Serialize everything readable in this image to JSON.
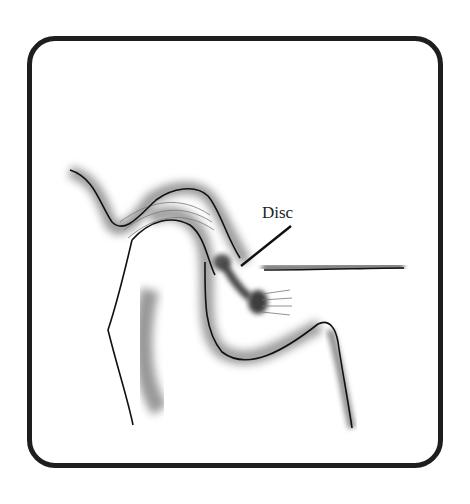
{
  "diagram": {
    "labels": [
      {
        "text": "Disc",
        "points_to": "articular disc"
      }
    ],
    "colors": {
      "frame": "#1e1e1e",
      "shading": "#5a5a5a",
      "line": "#111111",
      "background": "#ffffff"
    }
  }
}
